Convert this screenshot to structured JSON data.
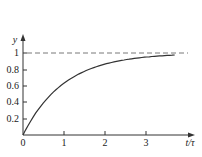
{
  "chart_data": {
    "type": "line",
    "title": "",
    "xlabel": "t/τ",
    "ylabel": "y",
    "xlim": [
      0,
      4
    ],
    "ylim": [
      0,
      1.1
    ],
    "x_ticks": [
      "0",
      "1",
      "2",
      "3"
    ],
    "y_ticks": [
      "0.2",
      "0.4",
      "0.6",
      "0.8",
      "1"
    ],
    "grid": false,
    "legend": null,
    "series": [
      {
        "name": "y = 1 - e^(-t/τ)",
        "style": "solid",
        "x": [
          0,
          0.25,
          0.5,
          0.75,
          1.0,
          1.5,
          2.0,
          2.5,
          3.0,
          3.7
        ],
        "values": [
          0,
          0.22,
          0.39,
          0.53,
          0.63,
          0.78,
          0.86,
          0.92,
          0.95,
          0.975
        ]
      },
      {
        "name": "asymptote y = 1",
        "style": "dashed",
        "x": [
          0,
          4
        ],
        "values": [
          1,
          1
        ]
      }
    ],
    "annotations": []
  },
  "axes": {
    "x_label": "t/τ",
    "y_label": "y",
    "origin_label": "0"
  }
}
